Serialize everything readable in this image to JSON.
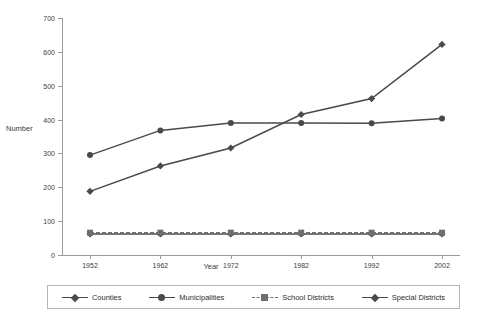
{
  "chart_data": {
    "type": "line",
    "title": "",
    "xlabel": "Year",
    "ylabel": "Number",
    "categories": [
      1952,
      1962,
      1972,
      1982,
      1992,
      2002
    ],
    "xtick_labels": [
      "1952",
      "1962",
      "1972",
      "1982",
      "1992",
      "2002"
    ],
    "ytick_labels": [
      "0",
      "100",
      "200",
      "300",
      "400",
      "500",
      "600",
      "700"
    ],
    "ylim": [
      0,
      700
    ],
    "ytick_step": 100,
    "grid": false,
    "legend_position": "bottom",
    "series": [
      {
        "name": "Counties",
        "marker": "diamond",
        "line": "solid",
        "color": "#4a4a4a",
        "values": [
          62,
          62,
          62,
          62,
          62,
          62
        ]
      },
      {
        "name": "Municipalities",
        "marker": "circle",
        "line": "solid",
        "color": "#4a4a4a",
        "values": [
          295,
          368,
          390,
          390,
          389,
          403
        ]
      },
      {
        "name": "School Districts",
        "marker": "square",
        "line": "dashed",
        "color": "#6e6e6e",
        "values": [
          66,
          66,
          66,
          66,
          66,
          66
        ]
      },
      {
        "name": "Special Districts",
        "marker": "diamond",
        "line": "solid",
        "color": "#4a4a4a",
        "values": [
          188,
          263,
          316,
          415,
          462,
          622
        ]
      }
    ]
  },
  "legend": {
    "items": [
      {
        "label": "Counties"
      },
      {
        "label": "Municipalities"
      },
      {
        "label": "School Districts"
      },
      {
        "label": "Special Districts"
      }
    ]
  },
  "colors": {
    "axis": "#9a9a9a",
    "text": "#333333",
    "series_dark": "#4a4a4a",
    "series_mid": "#6e6e6e",
    "legend_border": "#b5b5b5",
    "background": "#ffffff"
  }
}
